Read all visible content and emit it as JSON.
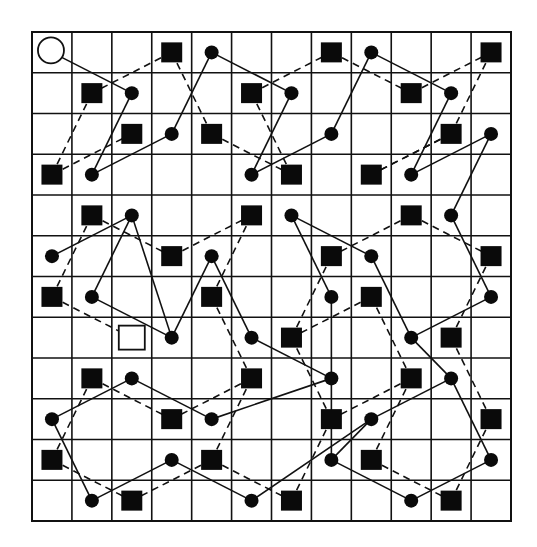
{
  "diagram": {
    "title": "",
    "grid": {
      "rows": 12,
      "cols": 12,
      "left": 32,
      "top": 32,
      "right": 511,
      "bottom": 521
    },
    "colors": {
      "line": "#111111",
      "fill": "#0a0a0a",
      "background": "#ffffff"
    },
    "legend": {
      "open_circle": "start marker (circle-open-icon)",
      "open_square": "end marker (square-open-icon)",
      "dot": "filled dot node",
      "square": "filled square node"
    },
    "nodes": [
      {
        "id": "c0",
        "type": "open_circle",
        "r": 0,
        "c": 0
      },
      {
        "id": "s0_3",
        "type": "square",
        "r": 0,
        "c": 3
      },
      {
        "id": "d0_4",
        "type": "dot",
        "r": 0,
        "c": 4
      },
      {
        "id": "s0_7",
        "type": "square",
        "r": 0,
        "c": 7
      },
      {
        "id": "d0_8",
        "type": "dot",
        "r": 0,
        "c": 8
      },
      {
        "id": "s0_11",
        "type": "square",
        "r": 0,
        "c": 11
      },
      {
        "id": "s1_1",
        "type": "square",
        "r": 1,
        "c": 1
      },
      {
        "id": "d1_2",
        "type": "dot",
        "r": 1,
        "c": 2
      },
      {
        "id": "s1_5",
        "type": "square",
        "r": 1,
        "c": 5
      },
      {
        "id": "d1_6",
        "type": "dot",
        "r": 1,
        "c": 6
      },
      {
        "id": "s1_9",
        "type": "square",
        "r": 1,
        "c": 9
      },
      {
        "id": "d1_10",
        "type": "dot",
        "r": 1,
        "c": 10
      },
      {
        "id": "s2_2",
        "type": "square",
        "r": 2,
        "c": 2
      },
      {
        "id": "d2_3",
        "type": "dot",
        "r": 2,
        "c": 3
      },
      {
        "id": "s2_4",
        "type": "square",
        "r": 2,
        "c": 4
      },
      {
        "id": "d2_7",
        "type": "dot",
        "r": 2,
        "c": 7
      },
      {
        "id": "s2_10",
        "type": "square",
        "r": 2,
        "c": 10
      },
      {
        "id": "d2_11",
        "type": "dot",
        "r": 2,
        "c": 11
      },
      {
        "id": "s3_0",
        "type": "square",
        "r": 3,
        "c": 0
      },
      {
        "id": "d3_1",
        "type": "dot",
        "r": 3,
        "c": 1
      },
      {
        "id": "d3_5",
        "type": "dot",
        "r": 3,
        "c": 5
      },
      {
        "id": "s3_6",
        "type": "square",
        "r": 3,
        "c": 6
      },
      {
        "id": "s3_8",
        "type": "square",
        "r": 3,
        "c": 8
      },
      {
        "id": "d3_9",
        "type": "dot",
        "r": 3,
        "c": 9
      },
      {
        "id": "s4_1",
        "type": "square",
        "r": 4,
        "c": 1
      },
      {
        "id": "d4_2",
        "type": "dot",
        "r": 4,
        "c": 2
      },
      {
        "id": "s4_5",
        "type": "square",
        "r": 4,
        "c": 5
      },
      {
        "id": "d4_6",
        "type": "dot",
        "r": 4,
        "c": 6
      },
      {
        "id": "s4_9",
        "type": "square",
        "r": 4,
        "c": 9
      },
      {
        "id": "d4_10",
        "type": "dot",
        "r": 4,
        "c": 10
      },
      {
        "id": "d5_0",
        "type": "dot",
        "r": 5,
        "c": 0
      },
      {
        "id": "s5_3",
        "type": "square",
        "r": 5,
        "c": 3
      },
      {
        "id": "d5_4",
        "type": "dot",
        "r": 5,
        "c": 4
      },
      {
        "id": "s5_7",
        "type": "square",
        "r": 5,
        "c": 7
      },
      {
        "id": "d5_8",
        "type": "dot",
        "r": 5,
        "c": 8
      },
      {
        "id": "s5_11",
        "type": "square",
        "r": 5,
        "c": 11
      },
      {
        "id": "s6_0",
        "type": "square",
        "r": 6,
        "c": 0
      },
      {
        "id": "d6_1",
        "type": "dot",
        "r": 6,
        "c": 1
      },
      {
        "id": "s6_4",
        "type": "square",
        "r": 6,
        "c": 4
      },
      {
        "id": "d6_7",
        "type": "dot",
        "r": 6,
        "c": 7
      },
      {
        "id": "s6_8",
        "type": "square",
        "r": 6,
        "c": 8
      },
      {
        "id": "d6_11",
        "type": "dot",
        "r": 6,
        "c": 11
      },
      {
        "id": "o7_2",
        "type": "open_square",
        "r": 7,
        "c": 2
      },
      {
        "id": "d7_3",
        "type": "dot",
        "r": 7,
        "c": 3
      },
      {
        "id": "d7_5",
        "type": "dot",
        "r": 7,
        "c": 5
      },
      {
        "id": "s7_6",
        "type": "square",
        "r": 7,
        "c": 6
      },
      {
        "id": "d7_9",
        "type": "dot",
        "r": 7,
        "c": 9
      },
      {
        "id": "s7_10",
        "type": "square",
        "r": 7,
        "c": 10
      },
      {
        "id": "s8_1",
        "type": "square",
        "r": 8,
        "c": 1
      },
      {
        "id": "d8_2",
        "type": "dot",
        "r": 8,
        "c": 2
      },
      {
        "id": "s8_5",
        "type": "square",
        "r": 8,
        "c": 5
      },
      {
        "id": "d8_7",
        "type": "dot",
        "r": 8,
        "c": 7
      },
      {
        "id": "s8_9",
        "type": "square",
        "r": 8,
        "c": 9
      },
      {
        "id": "d8_10",
        "type": "dot",
        "r": 8,
        "c": 10
      },
      {
        "id": "d9_0",
        "type": "dot",
        "r": 9,
        "c": 0
      },
      {
        "id": "s9_3",
        "type": "square",
        "r": 9,
        "c": 3
      },
      {
        "id": "d9_4",
        "type": "dot",
        "r": 9,
        "c": 4
      },
      {
        "id": "s9_7",
        "type": "square",
        "r": 9,
        "c": 7
      },
      {
        "id": "d9_8",
        "type": "dot",
        "r": 9,
        "c": 8
      },
      {
        "id": "s9_11",
        "type": "square",
        "r": 9,
        "c": 11
      },
      {
        "id": "s10_0",
        "type": "square",
        "r": 10,
        "c": 0
      },
      {
        "id": "d10_3",
        "type": "dot",
        "r": 10,
        "c": 3
      },
      {
        "id": "s10_4",
        "type": "square",
        "r": 10,
        "c": 4
      },
      {
        "id": "d10_7",
        "type": "dot",
        "r": 10,
        "c": 7
      },
      {
        "id": "s10_8",
        "type": "square",
        "r": 10,
        "c": 8
      },
      {
        "id": "d10_11",
        "type": "dot",
        "r": 10,
        "c": 11
      },
      {
        "id": "d11_1",
        "type": "dot",
        "r": 11,
        "c": 1
      },
      {
        "id": "s11_2",
        "type": "square",
        "r": 11,
        "c": 2
      },
      {
        "id": "d11_5",
        "type": "dot",
        "r": 11,
        "c": 5
      },
      {
        "id": "s11_6",
        "type": "square",
        "r": 11,
        "c": 6
      },
      {
        "id": "d11_9",
        "type": "dot",
        "r": 11,
        "c": 9
      },
      {
        "id": "s11_10",
        "type": "square",
        "r": 11,
        "c": 10
      }
    ],
    "edges": [
      {
        "from": "c0",
        "to": "d1_2",
        "style": "solid"
      },
      {
        "from": "d1_2",
        "to": "d3_1",
        "style": "solid"
      },
      {
        "from": "d3_1",
        "to": "d2_3",
        "style": "solid"
      },
      {
        "from": "d2_3",
        "to": "d0_4",
        "style": "solid"
      },
      {
        "from": "d0_4",
        "to": "d1_6",
        "style": "solid"
      },
      {
        "from": "d1_6",
        "to": "d3_5",
        "style": "solid"
      },
      {
        "from": "d3_5",
        "to": "d2_7",
        "style": "solid"
      },
      {
        "from": "d2_7",
        "to": "d0_8",
        "style": "solid"
      },
      {
        "from": "d0_8",
        "to": "d1_10",
        "style": "solid"
      },
      {
        "from": "d1_10",
        "to": "d3_9",
        "style": "solid"
      },
      {
        "from": "d3_9",
        "to": "d2_11",
        "style": "solid"
      },
      {
        "from": "d2_11",
        "to": "d4_10",
        "style": "solid"
      },
      {
        "from": "d4_10",
        "to": "d6_11",
        "style": "solid"
      },
      {
        "from": "d6_11",
        "to": "d7_9",
        "style": "solid"
      },
      {
        "from": "d7_9",
        "to": "d5_8",
        "style": "solid"
      },
      {
        "from": "d5_8",
        "to": "d4_6",
        "style": "solid"
      },
      {
        "from": "d4_6",
        "to": "d6_7",
        "style": "solid"
      },
      {
        "from": "d6_7",
        "to": "d8_7",
        "style": "solid"
      },
      {
        "from": "d8_7",
        "to": "d7_5",
        "style": "solid"
      },
      {
        "from": "d7_5",
        "to": "d5_4",
        "style": "solid"
      },
      {
        "from": "d5_4",
        "to": "d7_3",
        "style": "solid"
      },
      {
        "from": "d7_3",
        "to": "d4_2",
        "style": "solid"
      },
      {
        "from": "d4_2",
        "to": "d5_0",
        "style": "solid"
      },
      {
        "from": "d4_2",
        "to": "d6_1",
        "style": "solid"
      },
      {
        "from": "d6_1",
        "to": "d7_3",
        "style": "solid"
      },
      {
        "from": "d8_2",
        "to": "d9_0",
        "style": "solid"
      },
      {
        "from": "d8_2",
        "to": "d9_4",
        "style": "solid"
      },
      {
        "from": "d9_4",
        "to": "d8_7",
        "style": "solid"
      },
      {
        "from": "d8_7",
        "to": "d10_7",
        "style": "solid"
      },
      {
        "from": "d9_0",
        "to": "d11_1",
        "style": "solid"
      },
      {
        "from": "d11_1",
        "to": "d10_3",
        "style": "solid"
      },
      {
        "from": "d10_3",
        "to": "d11_5",
        "style": "solid"
      },
      {
        "from": "d11_5",
        "to": "d9_8",
        "style": "solid"
      },
      {
        "from": "d9_8",
        "to": "d10_7",
        "style": "solid"
      },
      {
        "from": "d9_8",
        "to": "d8_10",
        "style": "solid"
      },
      {
        "from": "d8_10",
        "to": "d10_11",
        "style": "solid"
      },
      {
        "from": "d10_11",
        "to": "d11_9",
        "style": "solid"
      },
      {
        "from": "d11_9",
        "to": "d10_7",
        "style": "solid"
      },
      {
        "from": "d7_9",
        "to": "d8_10",
        "style": "solid"
      },
      {
        "from": "s0_3",
        "to": "s1_1",
        "style": "dashed"
      },
      {
        "from": "s1_1",
        "to": "s3_0",
        "style": "dashed"
      },
      {
        "from": "s3_0",
        "to": "s2_2",
        "style": "dashed"
      },
      {
        "from": "s0_3",
        "to": "s2_4",
        "style": "dashed"
      },
      {
        "from": "s2_4",
        "to": "s3_6",
        "style": "dashed"
      },
      {
        "from": "s1_5",
        "to": "s3_6",
        "style": "dashed"
      },
      {
        "from": "s1_5",
        "to": "s0_7",
        "style": "dashed"
      },
      {
        "from": "s0_7",
        "to": "s1_9",
        "style": "dashed"
      },
      {
        "from": "s1_9",
        "to": "s0_11",
        "style": "dashed"
      },
      {
        "from": "s0_11",
        "to": "s2_10",
        "style": "dashed"
      },
      {
        "from": "s2_10",
        "to": "s3_8",
        "style": "dashed"
      },
      {
        "from": "s2_10",
        "to": "s3_8",
        "style": "dashed"
      },
      {
        "from": "s3_8",
        "to": "s4_6",
        "style": "dashed"
      },
      {
        "from": "s4_1",
        "to": "s5_3",
        "style": "dashed"
      },
      {
        "from": "s4_1",
        "to": "s6_0",
        "style": "dashed"
      },
      {
        "from": "s6_0",
        "to": "o7_2",
        "style": "dashed"
      },
      {
        "from": "s5_3",
        "to": "s4_5",
        "style": "dashed"
      },
      {
        "from": "s4_5",
        "to": "s6_4",
        "style": "dashed"
      },
      {
        "from": "s6_4",
        "to": "s8_5",
        "style": "dashed"
      },
      {
        "from": "s4_9",
        "to": "s5_7",
        "style": "dashed"
      },
      {
        "from": "s4_9",
        "to": "s5_11",
        "style": "dashed"
      },
      {
        "from": "s5_11",
        "to": "s7_10",
        "style": "dashed"
      },
      {
        "from": "s7_10",
        "to": "s9_11",
        "style": "dashed"
      },
      {
        "from": "s5_7",
        "to": "s7_6",
        "style": "dashed"
      },
      {
        "from": "s6_8",
        "to": "s7_6",
        "style": "dashed"
      },
      {
        "from": "s6_8",
        "to": "s8_9",
        "style": "dashed"
      },
      {
        "from": "s8_9",
        "to": "s10_8",
        "style": "dashed"
      },
      {
        "from": "s8_9",
        "to": "s9_7",
        "style": "dashed"
      },
      {
        "from": "s7_6",
        "to": "s9_7",
        "style": "dashed"
      },
      {
        "from": "s9_7",
        "to": "s11_6",
        "style": "dashed"
      },
      {
        "from": "s8_5",
        "to": "s9_3",
        "style": "dashed"
      },
      {
        "from": "s8_1",
        "to": "s9_3",
        "style": "dashed"
      },
      {
        "from": "s8_1",
        "to": "s10_0",
        "style": "dashed"
      },
      {
        "from": "s10_0",
        "to": "s11_2",
        "style": "dashed"
      },
      {
        "from": "s10_4",
        "to": "s11_2",
        "style": "dashed"
      },
      {
        "from": "s10_4",
        "to": "s11_6",
        "style": "dashed"
      },
      {
        "from": "s8_5",
        "to": "s10_4",
        "style": "dashed"
      },
      {
        "from": "s10_8",
        "to": "s11_10",
        "style": "dashed"
      },
      {
        "from": "s9_11",
        "to": "s11_10",
        "style": "dashed"
      }
    ]
  }
}
